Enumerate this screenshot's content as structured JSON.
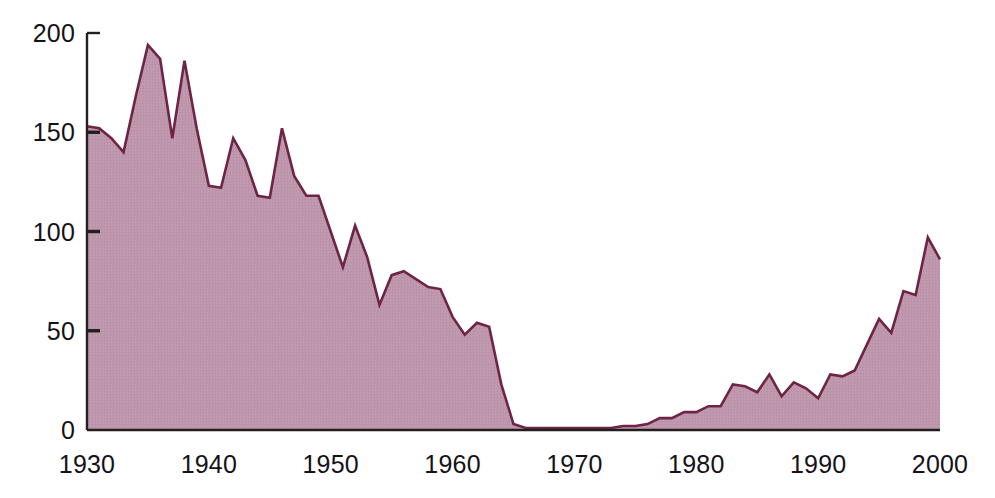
{
  "chart_data": {
    "type": "area",
    "title": "",
    "subtitle": "",
    "xlabel": "",
    "ylabel": "",
    "xlim": [
      1930,
      2000
    ],
    "ylim": [
      0,
      200
    ],
    "grid": false,
    "legend": null,
    "series_name": "",
    "fill_color": "#bd96ac",
    "line_color": "#6e2545",
    "axis_color": "#231f20",
    "text_color": "#141118",
    "x_ticks": [
      1930,
      1940,
      1950,
      1960,
      1970,
      1980,
      1990,
      2000
    ],
    "x_tick_labels": [
      "1930",
      "1940",
      "1950",
      "1960",
      "1970",
      "1980",
      "1990",
      "2000"
    ],
    "y_ticks": [
      0,
      50,
      100,
      150,
      200
    ],
    "y_tick_labels": [
      "0",
      "50",
      "100",
      "150",
      "200"
    ],
    "x": [
      1930,
      1931,
      1932,
      1933,
      1934,
      1935,
      1936,
      1937,
      1938,
      1939,
      1940,
      1941,
      1942,
      1943,
      1944,
      1945,
      1946,
      1947,
      1948,
      1949,
      1950,
      1951,
      1952,
      1953,
      1954,
      1955,
      1956,
      1957,
      1958,
      1959,
      1960,
      1961,
      1962,
      1963,
      1964,
      1965,
      1966,
      1967,
      1968,
      1969,
      1970,
      1971,
      1972,
      1973,
      1974,
      1975,
      1976,
      1977,
      1978,
      1979,
      1980,
      1981,
      1982,
      1983,
      1984,
      1985,
      1986,
      1987,
      1988,
      1989,
      1990,
      1991,
      1992,
      1993,
      1994,
      1995,
      1996,
      1997,
      1998,
      1999,
      2000
    ],
    "values": [
      153,
      152,
      147,
      140,
      168,
      194,
      187,
      147,
      186,
      152,
      123,
      122,
      147,
      136,
      118,
      117,
      152,
      128,
      118,
      118,
      100,
      82,
      103,
      87,
      63,
      78,
      80,
      76,
      72,
      71,
      57,
      48,
      54,
      52,
      23,
      3,
      1,
      1,
      1,
      1,
      1,
      1,
      1,
      1,
      2,
      2,
      3,
      6,
      6,
      9,
      9,
      12,
      12,
      23,
      22,
      19,
      28,
      17,
      24,
      21,
      16,
      28,
      27,
      30,
      43,
      56,
      49,
      70,
      68,
      97,
      86
    ]
  }
}
